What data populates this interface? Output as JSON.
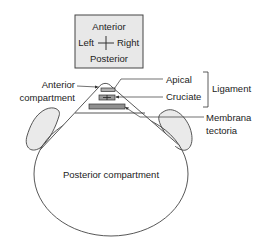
{
  "orientation_box": {
    "top": "Anterior",
    "left": "Left",
    "right": "Right",
    "bottom": "Posterior"
  },
  "labels": {
    "anterior_compartment_line1": "Anterior",
    "anterior_compartment_line2": "compartment",
    "apical": "Apical",
    "cruciate": "Cruciate",
    "ligament": "Ligament",
    "membrana_line1": "Membrana",
    "membrana_line2": "tectoria",
    "posterior_compartment": "Posterior compartment"
  },
  "colors": {
    "line": "#333333",
    "box_fill": "#e8e8e8",
    "lobe_fill": "#eaeaea",
    "ligament_fill": "#9a9a9a",
    "background": "#ffffff"
  }
}
